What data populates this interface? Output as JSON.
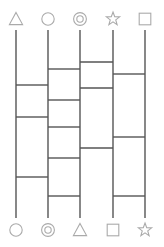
{
  "puzzle": {
    "title": "amidakuji-ladder",
    "type": "ghost-leg-ladder",
    "canvas": {
      "width": 164,
      "height": 247
    },
    "background_color": "#ffffff",
    "line_color": "#555555",
    "icon_color": "#aaaaaa",
    "line_width": 1.4,
    "rung_width": 1.4,
    "columns": 5,
    "column_x": [
      16,
      48,
      80,
      113,
      145
    ],
    "line_top_y": 30,
    "line_bottom_y": 218,
    "top_icon_y": 19,
    "bottom_icon_y": 230,
    "top_icons": [
      {
        "name": "triangle-icon",
        "shape": "triangle",
        "label": "triangle"
      },
      {
        "name": "circle-icon",
        "shape": "circle",
        "label": "circle"
      },
      {
        "name": "double-circle-icon",
        "shape": "double-circle",
        "label": "double-circle"
      },
      {
        "name": "star-icon",
        "shape": "star",
        "label": "star"
      },
      {
        "name": "square-icon",
        "shape": "square",
        "label": "square"
      }
    ],
    "bottom_icons": [
      {
        "name": "circle-icon",
        "shape": "circle",
        "label": "circle"
      },
      {
        "name": "double-circle-icon",
        "shape": "double-circle",
        "label": "double-circle"
      },
      {
        "name": "triangle-icon",
        "shape": "triangle",
        "label": "triangle"
      },
      {
        "name": "square-icon",
        "shape": "square",
        "label": "square"
      },
      {
        "name": "star-icon",
        "shape": "star",
        "label": "star"
      }
    ],
    "rungs": [
      {
        "from": 3,
        "to": 4,
        "y": 62
      },
      {
        "from": 2,
        "to": 3,
        "y": 69
      },
      {
        "from": 4,
        "to": 5,
        "y": 74
      },
      {
        "from": 3,
        "to": 4,
        "y": 88
      },
      {
        "from": 1,
        "to": 2,
        "y": 85
      },
      {
        "from": 2,
        "to": 3,
        "y": 100
      },
      {
        "from": 1,
        "to": 2,
        "y": 117
      },
      {
        "from": 2,
        "to": 3,
        "y": 127
      },
      {
        "from": 4,
        "to": 5,
        "y": 137
      },
      {
        "from": 3,
        "to": 4,
        "y": 148
      },
      {
        "from": 2,
        "to": 3,
        "y": 158
      },
      {
        "from": 1,
        "to": 2,
        "y": 177
      },
      {
        "from": 2,
        "to": 3,
        "y": 196
      },
      {
        "from": 4,
        "to": 5,
        "y": 196
      }
    ]
  }
}
